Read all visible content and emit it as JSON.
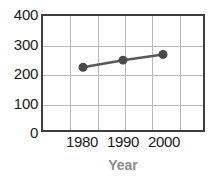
{
  "chart_data": {
    "type": "line",
    "title": "",
    "subtitle": "",
    "xlabel": "Year",
    "ylabel": "",
    "x": [
      1980,
      1990,
      2000
    ],
    "categories": [
      "1980",
      "1990",
      "2000"
    ],
    "values": [
      220,
      245,
      265
    ],
    "series": [
      {
        "name": "",
        "values": [
          220,
          245,
          265
        ]
      }
    ],
    "xlim": [
      1970,
      2010
    ],
    "ylim": [
      0,
      400
    ],
    "y_ticks": [
      0,
      100,
      200,
      300,
      400
    ],
    "y_tick_labels": [
      "0",
      "100",
      "200",
      "300",
      "400"
    ],
    "x_ticks": [
      1980,
      1990,
      2000
    ],
    "x_tick_labels": [
      "1980",
      "1990",
      "2000"
    ],
    "grid": true,
    "grid_horizontal_count": 3,
    "grid_vertical_count": 5,
    "legend": false,
    "legend_position": "none",
    "annotations": [],
    "colors": {
      "marker": "#4a4a4a",
      "line": "#58595b",
      "axis_frame": "#3d3d3d",
      "gridline": "#b9b9b9",
      "tick_label": "#1a1a1a",
      "axis_title": "#8c8c8c",
      "background": "#ffffff"
    }
  }
}
